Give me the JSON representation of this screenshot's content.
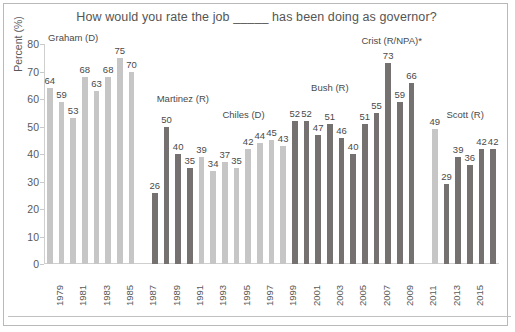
{
  "chart_data": {
    "type": "bar",
    "title": "How would you rate the job _____ has been doing as governor?",
    "xlabel": "",
    "ylabel": "Percent (%)",
    "ylim": [
      0,
      80
    ],
    "ytick_values": [
      0,
      10,
      20,
      30,
      40,
      50,
      60,
      70,
      80
    ],
    "ytick_labels": [
      "0",
      "10",
      "20",
      "30",
      "40",
      "50",
      "60",
      "70",
      "80"
    ],
    "xtick_labels": [
      "1979",
      "1981",
      "1983",
      "1985",
      "1987",
      "1989",
      "1991",
      "1993",
      "1995",
      "1997",
      "1999",
      "2001",
      "2003",
      "2005",
      "2007",
      "2009",
      "2011",
      "2013",
      "2015"
    ],
    "grid": false,
    "legend": "none",
    "colors": {
      "light": "#c6c6c6",
      "dark": "#767171",
      "text": "#595959",
      "border": "#b9b9b9"
    },
    "series": [
      {
        "name": "Graham (D)",
        "color": "light",
        "values": [
          64,
          59,
          53,
          68,
          63,
          68,
          75,
          70
        ]
      },
      {
        "name": "Martinez (R)",
        "color": "dark",
        "values": [
          26,
          50,
          40,
          35,
          39,
          34,
          37,
          35
        ]
      },
      {
        "name": "Chiles (D)",
        "color": "light",
        "values": [
          42,
          44,
          45,
          43
        ]
      },
      {
        "name": "Bush (R)",
        "color": "dark",
        "values": [
          52,
          52,
          47,
          51,
          46,
          40,
          51,
          55
        ]
      },
      {
        "name": "Crist (R/NPA)*",
        "color": "dark",
        "values": [
          73,
          59,
          66
        ]
      },
      {
        "name": "",
        "color": "light",
        "values": [
          49
        ]
      },
      {
        "name": "Scott (R)",
        "color": "dark",
        "values": [
          29,
          39,
          36,
          42,
          42
        ]
      }
    ],
    "bars": [
      {
        "slot": 0,
        "value": 64,
        "color": "light",
        "label": "64"
      },
      {
        "slot": 1,
        "value": 59,
        "color": "light",
        "label": "59"
      },
      {
        "slot": 2,
        "value": 53,
        "color": "light",
        "label": "53"
      },
      {
        "slot": 3,
        "value": 68,
        "color": "light",
        "label": "68"
      },
      {
        "slot": 4,
        "value": 63,
        "color": "light",
        "label": "63"
      },
      {
        "slot": 5,
        "value": 68,
        "color": "light",
        "label": "68"
      },
      {
        "slot": 6,
        "value": 75,
        "color": "light",
        "label": "75"
      },
      {
        "slot": 7,
        "value": 70,
        "color": "light",
        "label": "70"
      },
      {
        "slot": 9,
        "value": 26,
        "color": "dark",
        "label": "26"
      },
      {
        "slot": 10,
        "value": 50,
        "color": "dark",
        "label": "50"
      },
      {
        "slot": 11,
        "value": 40,
        "color": "dark",
        "label": "40"
      },
      {
        "slot": 12,
        "value": 35,
        "color": "dark",
        "label": "35"
      },
      {
        "slot": 13,
        "value": 39,
        "color": "light",
        "label": "39"
      },
      {
        "slot": 14,
        "value": 34,
        "color": "light",
        "label": "34"
      },
      {
        "slot": 15,
        "value": 37,
        "color": "light",
        "label": "37"
      },
      {
        "slot": 16,
        "value": 35,
        "color": "light",
        "label": "35"
      },
      {
        "slot": 17,
        "value": 42,
        "color": "light",
        "label": "42"
      },
      {
        "slot": 18,
        "value": 44,
        "color": "light",
        "label": "44"
      },
      {
        "slot": 19,
        "value": 45,
        "color": "light",
        "label": "45"
      },
      {
        "slot": 20,
        "value": 43,
        "color": "light",
        "label": "43"
      },
      {
        "slot": 21,
        "value": 52,
        "color": "dark",
        "label": "52"
      },
      {
        "slot": 22,
        "value": 52,
        "color": "dark",
        "label": "52"
      },
      {
        "slot": 23,
        "value": 47,
        "color": "dark",
        "label": "47"
      },
      {
        "slot": 24,
        "value": 51,
        "color": "dark",
        "label": "51"
      },
      {
        "slot": 25,
        "value": 46,
        "color": "dark",
        "label": "46"
      },
      {
        "slot": 26,
        "value": 40,
        "color": "dark",
        "label": "40"
      },
      {
        "slot": 27,
        "value": 51,
        "color": "dark",
        "label": "51"
      },
      {
        "slot": 28,
        "value": 55,
        "color": "dark",
        "label": "55"
      },
      {
        "slot": 29,
        "value": 73,
        "color": "dark",
        "label": "73"
      },
      {
        "slot": 30,
        "value": 59,
        "color": "dark",
        "label": "59"
      },
      {
        "slot": 31,
        "value": 66,
        "color": "dark",
        "label": "66"
      },
      {
        "slot": 33,
        "value": 49,
        "color": "light",
        "label": "49"
      },
      {
        "slot": 34,
        "value": 29,
        "color": "dark",
        "label": "29"
      },
      {
        "slot": 35,
        "value": 39,
        "color": "dark",
        "label": "39"
      },
      {
        "slot": 36,
        "value": 36,
        "color": "dark",
        "label": "36"
      },
      {
        "slot": 37,
        "value": 42,
        "color": "dark",
        "label": "42"
      },
      {
        "slot": 38,
        "value": 42,
        "color": "dark",
        "label": "42"
      }
    ],
    "annotations": [
      {
        "text": "Graham (D)",
        "slot": 2.0,
        "value": 80
      },
      {
        "text": "Martinez (R)",
        "slot": 11.4,
        "value": 58
      },
      {
        "text": "Chiles (D)",
        "slot": 16.6,
        "value": 52
      },
      {
        "text": "Bush (R)",
        "slot": 24.0,
        "value": 62
      },
      {
        "text": "Crist (R/NPA)*",
        "slot": 29.3,
        "value": 79
      },
      {
        "text": "Scott (R)",
        "slot": 35.6,
        "value": 52
      }
    ]
  }
}
